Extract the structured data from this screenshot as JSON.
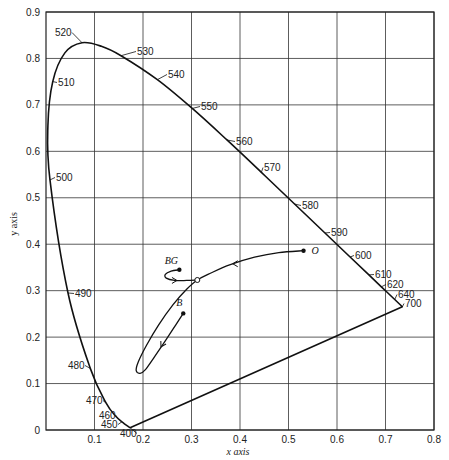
{
  "chart_data": {
    "type": "line",
    "title": "",
    "xlabel": "x axis",
    "ylabel": "y axis",
    "xlim": [
      0,
      0.8
    ],
    "ylim": [
      0,
      0.9
    ],
    "grid": true,
    "x_ticks": [
      0.1,
      0.2,
      0.3,
      0.4,
      0.5,
      0.6,
      0.7,
      0.8
    ],
    "x_tick_labels": [
      "0.1",
      "0.2",
      "0.3",
      "0.4",
      "0.5",
      "0.6",
      "0.7",
      "0.8"
    ],
    "y_ticks": [
      0,
      0.1,
      0.2,
      0.3,
      0.4,
      0.5,
      0.6,
      0.7,
      0.8,
      0.9
    ],
    "y_tick_labels": [
      "0",
      "0.1",
      "0.2",
      "0.3",
      "0.4",
      "0.5",
      "0.6",
      "0.7",
      "0.8",
      "0.9"
    ],
    "spectral_locus": {
      "name": "Spectral locus (wavelength, nm)",
      "points": [
        {
          "wl": "400",
          "x": 0.1733,
          "y": 0.0048,
          "lx": 120,
          "ly": 437,
          "anchor": "start"
        },
        {
          "wl": "450",
          "x": 0.1566,
          "y": 0.0177,
          "lx": 101,
          "ly": 428,
          "anchor": "start"
        },
        {
          "wl": "460",
          "x": 0.144,
          "y": 0.0297,
          "lx": 99,
          "ly": 419,
          "anchor": "start"
        },
        {
          "wl": "470",
          "x": 0.1241,
          "y": 0.0578,
          "lx": 86,
          "ly": 404,
          "anchor": "start"
        },
        {
          "wl": "480",
          "x": 0.0913,
          "y": 0.1327,
          "lx": 68,
          "ly": 369,
          "anchor": "start"
        },
        {
          "wl": "490",
          "x": 0.0454,
          "y": 0.295,
          "lx": 75,
          "ly": 297,
          "anchor": "start"
        },
        {
          "wl": "500",
          "x": 0.0082,
          "y": 0.5384,
          "lx": 56,
          "ly": 181,
          "anchor": "start"
        },
        {
          "wl": "",
          "x": 0.0039,
          "y": 0.6548
        },
        {
          "wl": "510",
          "x": 0.0139,
          "y": 0.7502,
          "lx": 58,
          "ly": 86,
          "anchor": "start"
        },
        {
          "wl": "",
          "x": 0.0389,
          "y": 0.812
        },
        {
          "wl": "520",
          "x": 0.0743,
          "y": 0.8338,
          "lx": 55,
          "ly": 36,
          "anchor": "start"
        },
        {
          "wl": "",
          "x": 0.1142,
          "y": 0.8262
        },
        {
          "wl": "530",
          "x": 0.1547,
          "y": 0.8059,
          "lx": 137,
          "ly": 55,
          "anchor": "start"
        },
        {
          "wl": "540",
          "x": 0.2296,
          "y": 0.7543,
          "lx": 168,
          "ly": 78,
          "anchor": "start"
        },
        {
          "wl": "550",
          "x": 0.3016,
          "y": 0.6923,
          "lx": 201,
          "ly": 110,
          "anchor": "start"
        },
        {
          "wl": "560",
          "x": 0.3731,
          "y": 0.6245,
          "lx": 236,
          "ly": 145,
          "anchor": "start"
        },
        {
          "wl": "570",
          "x": 0.4441,
          "y": 0.5547,
          "lx": 264,
          "ly": 171,
          "anchor": "start"
        },
        {
          "wl": "580",
          "x": 0.5125,
          "y": 0.4866,
          "lx": 302,
          "ly": 209,
          "anchor": "start"
        },
        {
          "wl": "590",
          "x": 0.5752,
          "y": 0.4242,
          "lx": 331,
          "ly": 236,
          "anchor": "start"
        },
        {
          "wl": "600",
          "x": 0.627,
          "y": 0.3725,
          "lx": 355,
          "ly": 259,
          "anchor": "start"
        },
        {
          "wl": "610",
          "x": 0.6658,
          "y": 0.334,
          "lx": 375,
          "ly": 278,
          "anchor": "start"
        },
        {
          "wl": "620",
          "x": 0.6915,
          "y": 0.3083,
          "lx": 387,
          "ly": 288,
          "anchor": "start"
        },
        {
          "wl": "640",
          "x": 0.719,
          "y": 0.2809,
          "lx": 398,
          "ly": 298,
          "anchor": "start"
        },
        {
          "wl": "700",
          "x": 0.7347,
          "y": 0.2653,
          "lx": 405,
          "ly": 307,
          "anchor": "start"
        }
      ]
    },
    "trajectories": [
      {
        "name": "O to B path",
        "points": [
          [
            0.531,
            0.386
          ],
          [
            0.48,
            0.382
          ],
          [
            0.43,
            0.372
          ],
          [
            0.38,
            0.356
          ],
          [
            0.34,
            0.338
          ],
          [
            0.312,
            0.323
          ],
          [
            0.29,
            0.303
          ],
          [
            0.262,
            0.27
          ],
          [
            0.232,
            0.226
          ],
          [
            0.207,
            0.182
          ],
          [
            0.19,
            0.146
          ],
          [
            0.186,
            0.128
          ],
          [
            0.194,
            0.122
          ],
          [
            0.205,
            0.13
          ],
          [
            0.224,
            0.158
          ],
          [
            0.248,
            0.195
          ],
          [
            0.268,
            0.227
          ],
          [
            0.283,
            0.251
          ]
        ],
        "arrows": [
          {
            "x": 0.385,
            "y": 0.358,
            "dir": "left"
          },
          {
            "x": 0.237,
            "y": 0.179,
            "dir": "down-left"
          }
        ]
      },
      {
        "name": "BG branch",
        "points": [
          [
            0.312,
            0.323
          ],
          [
            0.29,
            0.322
          ],
          [
            0.265,
            0.322
          ],
          [
            0.248,
            0.327
          ],
          [
            0.246,
            0.335
          ],
          [
            0.258,
            0.342
          ],
          [
            0.275,
            0.345
          ]
        ],
        "arrows": [
          {
            "x": 0.27,
            "y": 0.322,
            "dir": "right"
          }
        ]
      }
    ],
    "marked_points": [
      {
        "label": "O",
        "x": 0.531,
        "y": 0.386,
        "style": "filled",
        "lx": 8,
        "ly": 3
      },
      {
        "label": "BG",
        "x": 0.275,
        "y": 0.345,
        "style": "filled",
        "lx": -8,
        "ly": -6
      },
      {
        "label": "B",
        "x": 0.283,
        "y": 0.251,
        "style": "filled",
        "lx": -4,
        "ly": -7
      },
      {
        "label": "",
        "x": 0.312,
        "y": 0.323,
        "style": "open"
      }
    ]
  },
  "labels": {
    "xlabel": "x axis",
    "ylabel": "y axis"
  }
}
